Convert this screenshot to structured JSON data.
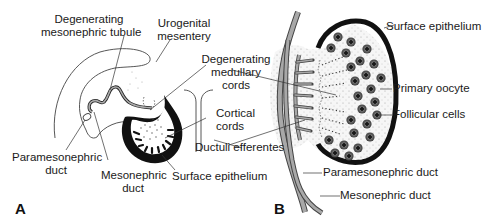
{
  "figure": {
    "panel_a": {
      "letter": "A",
      "labels": {
        "degenerating_mesonephric_tubule": [
          "Degenerating",
          "mesonephric tubule"
        ],
        "urogenital_mesentery": [
          "Urogenital",
          "mesentery"
        ],
        "degenerating_medullary_cords": [
          "Degenerating",
          "medullary",
          "cords"
        ],
        "cortical_cords": [
          "Cortical",
          "cords"
        ],
        "ductuli_efferentes": "Ductuli efferentes",
        "paramesonephric_duct": [
          "Paramesonephric",
          "duct"
        ],
        "mesonephric_duct": [
          "Mesonephric",
          "duct"
        ],
        "surface_epithelium": "Surface epithelium"
      }
    },
    "panel_b": {
      "letter": "B",
      "labels": {
        "surface_epithelium": "Surface epithelium",
        "primary_oocyte": "Primary oocyte",
        "follicular_cells": "Follicular cells",
        "paramesonephric_duct": "Paramesonephric duct",
        "mesonephric_duct": "Mesonephric duct"
      }
    },
    "colors": {
      "line": "#3a3a3a",
      "duct_fill": "#9a9a9a",
      "epithelium": "#111111",
      "stipple_bg": "#f1f1f1",
      "oocyte": "#3c3c3c"
    }
  }
}
